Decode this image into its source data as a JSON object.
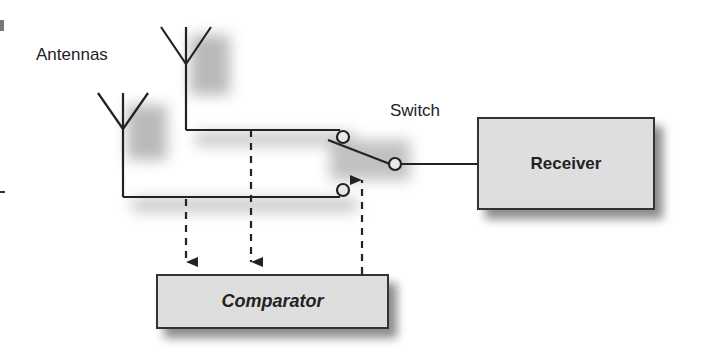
{
  "diagram": {
    "type": "antenna-diversity-switching",
    "labels": {
      "antennas": "Antennas",
      "switch": "Switch"
    },
    "blocks": {
      "receiver": "Receiver",
      "comparator": "Comparator"
    },
    "nodes": [
      {
        "id": "antenna-1",
        "kind": "antenna"
      },
      {
        "id": "antenna-2",
        "kind": "antenna"
      },
      {
        "id": "switch",
        "kind": "spdt-switch"
      },
      {
        "id": "receiver",
        "kind": "block"
      },
      {
        "id": "comparator",
        "kind": "block"
      }
    ],
    "edges": [
      {
        "from": "antenna-2",
        "to": "switch",
        "style": "solid",
        "note": "upper contact"
      },
      {
        "from": "antenna-1",
        "to": "switch",
        "style": "solid",
        "note": "lower contact"
      },
      {
        "from": "switch",
        "to": "receiver",
        "style": "solid"
      },
      {
        "from": "antenna-1",
        "to": "comparator",
        "style": "dashed-arrow"
      },
      {
        "from": "antenna-2",
        "to": "comparator",
        "style": "dashed-arrow"
      },
      {
        "from": "comparator",
        "to": "switch",
        "style": "dashed-arrow",
        "note": "control"
      }
    ],
    "colors": {
      "line": "#222222",
      "block_fill": "#dedede",
      "background": "#ffffff"
    }
  }
}
